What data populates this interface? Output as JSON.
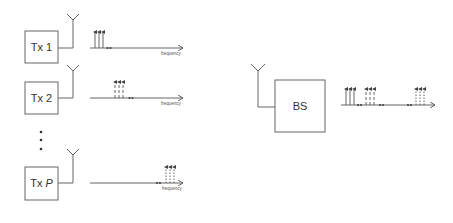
{
  "diagram": {
    "type": "multi-user uplink spectrum diagram",
    "colors": {
      "stroke": "#555555",
      "text": "#333333",
      "background": "#ffffff"
    },
    "transmitters": [
      {
        "id": "tx1",
        "label": "Tx 1",
        "label_prefix": "Tx ",
        "label_index": "1",
        "axis_label": "frequency",
        "subcarrier_style": "solid"
      },
      {
        "id": "tx2",
        "label": "Tx 2",
        "label_prefix": "Tx ",
        "label_index": "2",
        "axis_label": "frequency",
        "subcarrier_style": "dashed"
      },
      {
        "id": "txP",
        "label": "Tx P",
        "label_prefix": "Tx ",
        "label_index": "P",
        "axis_label": "frequency",
        "subcarrier_style": "dotted"
      }
    ],
    "ellipsis": "⋮",
    "receiver": {
      "id": "bs",
      "label": "BS"
    }
  }
}
